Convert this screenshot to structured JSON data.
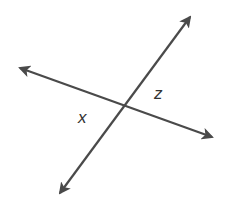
{
  "diagram": {
    "line_color": "#4a4a4a",
    "lines": [
      {
        "name": "steep-line",
        "from": [
          60,
          193
        ],
        "to": [
          190,
          17
        ],
        "arrows": "both"
      },
      {
        "name": "shallow-line",
        "from": [
          20,
          68
        ],
        "to": [
          212,
          137
        ],
        "arrows": "both"
      }
    ],
    "intersection": [
      124,
      107
    ],
    "labels": {
      "z": "z",
      "x": "x"
    }
  }
}
